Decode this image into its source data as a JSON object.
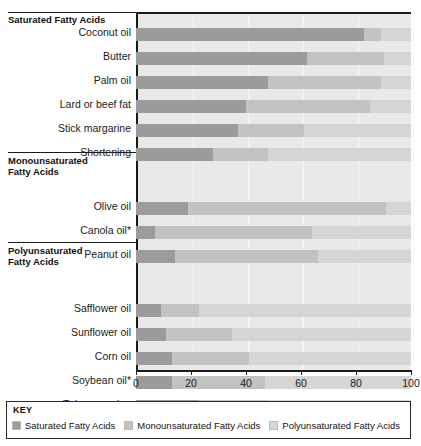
{
  "chart_data": {
    "type": "bar",
    "orientation": "horizontal",
    "stacked": true,
    "title": "",
    "xlabel": "",
    "ylabel": "",
    "xlim": [
      0,
      100
    ],
    "xticks": [
      0,
      20,
      40,
      60,
      80,
      100
    ],
    "xtick_labels": [
      "0",
      "20",
      "40",
      "60",
      "80",
      "100"
    ],
    "grid": true,
    "legend_position": "bottom",
    "categories": [
      "Coconut oil",
      "Butter",
      "Palm oil",
      "Lard or beef fat",
      "Stick margarine",
      "Shortening",
      "Olive oil",
      "Canola oil*",
      "Peanut oil",
      "Safflower oil",
      "Sunflower oil",
      "Corn oil",
      "Soybean oil*",
      "Tub margarine"
    ],
    "series": [
      {
        "name": "Saturated Fatty Acids",
        "color": "#9b9b9b",
        "values": [
          83,
          62,
          48,
          40,
          37,
          28,
          19,
          7,
          14,
          9,
          11,
          13,
          13,
          23
        ]
      },
      {
        "name": "Monounsaturated Fatty Acids",
        "color": "#c2c2c0",
        "values": [
          6,
          28,
          41,
          45,
          24,
          20,
          72,
          57,
          52,
          14,
          24,
          28,
          34,
          25
        ]
      },
      {
        "name": "Polyunsaturated Fatty Acids",
        "color": "#d5d5d3",
        "values": [
          11,
          10,
          11,
          15,
          39,
          52,
          9,
          36,
          34,
          77,
          65,
          59,
          53,
          52
        ]
      }
    ],
    "groups": [
      {
        "label_lines": [
          "Saturated Fatty Acids"
        ],
        "categories": [
          "Coconut oil",
          "Butter",
          "Palm oil",
          "Lard or beef fat",
          "Stick margarine",
          "Shortening"
        ]
      },
      {
        "label_lines": [
          "Monounsaturated",
          "Fatty Acids"
        ],
        "categories": [
          "Olive oil",
          "Canola oil*",
          "Peanut oil"
        ]
      },
      {
        "label_lines": [
          "Polyunsaturated",
          "Fatty Acids"
        ],
        "categories": [
          "Safflower oil",
          "Sunflower oil",
          "Corn oil",
          "Soybean oil*",
          "Tub margarine"
        ]
      }
    ]
  },
  "legend": {
    "title": "KEY",
    "items": [
      {
        "label": "Saturated Fatty Acids",
        "swatch": "sat"
      },
      {
        "label": "Monounsaturated Fatty Acids",
        "swatch": "mono"
      },
      {
        "label": "Polyunsaturated Fatty Acids",
        "swatch": "poly"
      }
    ]
  },
  "group_headings": {
    "saturated_line1": "Saturated Fatty Acids",
    "mono_line1": "Monounsaturated",
    "mono_line2": "Fatty Acids",
    "poly_line1": "Polyunsaturated",
    "poly_line2": "Fatty Acids"
  },
  "axis": {
    "ticks": [
      "0",
      "20",
      "40",
      "60",
      "80",
      "100"
    ]
  },
  "row_labels": {
    "r0": "Coconut oil",
    "r1": "Butter",
    "r2": "Palm oil",
    "r3": "Lard or beef fat",
    "r4": "Stick margarine",
    "r5": "Shortening",
    "r6": "Olive oil",
    "r7": "Canola oil*",
    "r8": "Peanut oil",
    "r9": "Safflower oil",
    "r10": "Sunflower oil",
    "r11": "Corn oil",
    "r12": "Soybean oil*",
    "r13": "Tub margarine"
  }
}
